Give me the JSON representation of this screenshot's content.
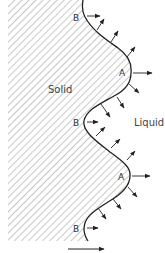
{
  "diagram": {
    "regions": {
      "solid_label": "Solid",
      "liquid_label": "Liquid"
    },
    "points": [
      {
        "id": "B1",
        "label": "B",
        "kind": "trough"
      },
      {
        "id": "A1",
        "label": "A",
        "kind": "crest"
      },
      {
        "id": "B2",
        "label": "B",
        "kind": "trough"
      },
      {
        "id": "A2",
        "label": "A",
        "kind": "crest"
      },
      {
        "id": "B3",
        "label": "B",
        "kind": "trough"
      }
    ],
    "flux_arrows_description": "Arrows normal to interface pointing into liquid",
    "bottom_arrow": "growth direction",
    "colors": {
      "line": "#222222",
      "hatch": "#9a9a9a",
      "text": "#333333",
      "background": "#ffffff"
    }
  }
}
